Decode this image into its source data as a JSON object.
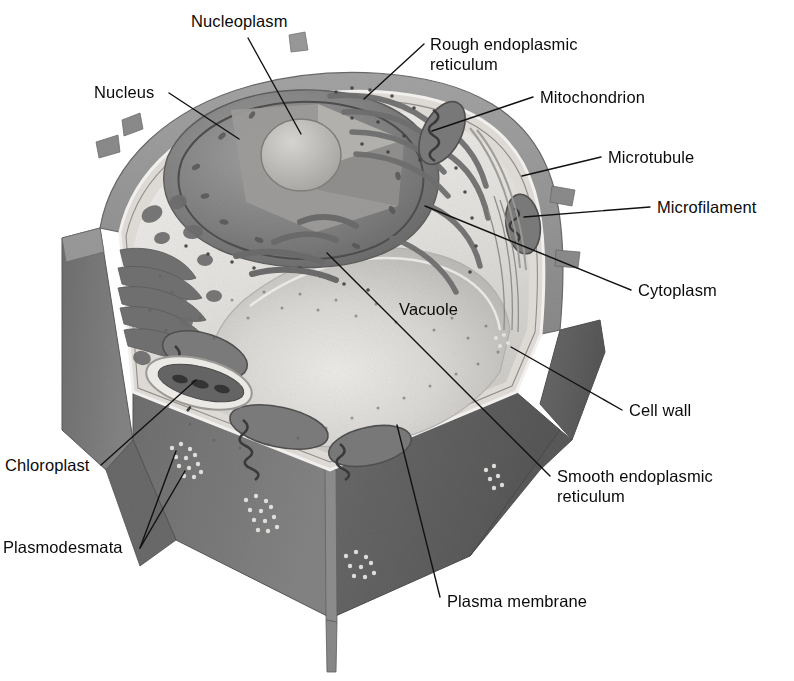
{
  "figure": {
    "background_color": "#ffffff",
    "label_text_color": "#0b0b0b",
    "leader_line_color": "#111111",
    "palette": {
      "cell_wall_outer": "#8f8f8f",
      "cell_wall_face_dark": "#6e6e6e",
      "cell_wall_face_darker": "#5c5c5c",
      "cell_wall_edge_light": "#c9c9c9",
      "cytoplasm": "#e2e0dd",
      "cytoplasm_light": "#efeeec",
      "vacuole": "#cfcdca",
      "vacuole_light": "#dedcd9",
      "nucleus": "#8a8a8a",
      "nucleus_dark": "#6f6f6f",
      "nucleolus": "#b9b7b4",
      "organelle_dark": "#555555",
      "organelle_mid": "#7b7b7b",
      "membrane_line": "#9a9a9a"
    }
  },
  "labels": [
    {
      "id": "nucleoplasm",
      "text": "Nucleoplasm",
      "x": 191,
      "y": 11,
      "anchor": "start",
      "leader": {
        "x1": 248,
        "y1": 38,
        "x2": 301,
        "y2": 134
      }
    },
    {
      "id": "nucleus",
      "text": "Nucleus",
      "x": 94,
      "y": 82,
      "anchor": "start",
      "leader": {
        "x1": 169,
        "y1": 93,
        "x2": 239,
        "y2": 139
      }
    },
    {
      "id": "rough-endoplasmic-reticulum",
      "text": "Rough endoplasmic\nreticulum",
      "x": 430,
      "y": 34,
      "anchor": "start",
      "leader": {
        "x1": 424,
        "y1": 44,
        "x2": 364,
        "y2": 99
      }
    },
    {
      "id": "mitochondrion",
      "text": "Mitochondrion",
      "x": 540,
      "y": 87,
      "anchor": "start",
      "leader": {
        "x1": 533,
        "y1": 97,
        "x2": 432,
        "y2": 131
      }
    },
    {
      "id": "microtubule",
      "text": "Microtubule",
      "x": 608,
      "y": 147,
      "anchor": "start",
      "leader": {
        "x1": 601,
        "y1": 157,
        "x2": 522,
        "y2": 176
      }
    },
    {
      "id": "microfilament",
      "text": "Microfilament",
      "x": 657,
      "y": 197,
      "anchor": "start",
      "leader": {
        "x1": 650,
        "y1": 207,
        "x2": 524,
        "y2": 217
      }
    },
    {
      "id": "cytoplasm",
      "text": "Cytoplasm",
      "x": 638,
      "y": 280,
      "anchor": "start",
      "leader": {
        "x1": 631,
        "y1": 290,
        "x2": 425,
        "y2": 206
      }
    },
    {
      "id": "vacuole",
      "text": "Vacuole",
      "x": 399,
      "y": 299,
      "anchor": "start",
      "leader": null
    },
    {
      "id": "cell-wall",
      "text": "Cell wall",
      "x": 629,
      "y": 400,
      "anchor": "start",
      "leader": {
        "x1": 622,
        "y1": 410,
        "x2": 511,
        "y2": 347
      }
    },
    {
      "id": "smooth-endoplasmic-reticulum",
      "text": "Smooth endoplasmic\nreticulum",
      "x": 557,
      "y": 466,
      "anchor": "start",
      "leader": {
        "x1": 550,
        "y1": 476,
        "x2": 327,
        "y2": 253
      }
    },
    {
      "id": "chloroplast",
      "text": "Chloroplast",
      "x": 5,
      "y": 455,
      "anchor": "start",
      "leader": {
        "x1": 101,
        "y1": 465,
        "x2": 196,
        "y2": 380
      }
    },
    {
      "id": "plasmodesmata",
      "text": "Plasmodesmata",
      "x": 3,
      "y": 537,
      "anchor": "start",
      "leader": null,
      "leaders": [
        {
          "x1": 140,
          "y1": 548,
          "x2": 176,
          "y2": 451
        },
        {
          "x1": 140,
          "y1": 548,
          "x2": 185,
          "y2": 471
        }
      ]
    },
    {
      "id": "plasma-membrane",
      "text": "Plasma membrane",
      "x": 447,
      "y": 591,
      "anchor": "start",
      "leader": {
        "x1": 440,
        "y1": 597,
        "x2": 397,
        "y2": 425
      }
    }
  ],
  "structures": [
    {
      "id": "cell-wall",
      "name": "Cell wall"
    },
    {
      "id": "plasma-membrane",
      "name": "Plasma membrane"
    },
    {
      "id": "cytoplasm",
      "name": "Cytoplasm"
    },
    {
      "id": "nucleus",
      "name": "Nucleus"
    },
    {
      "id": "nucleoplasm",
      "name": "Nucleoplasm"
    },
    {
      "id": "vacuole",
      "name": "Vacuole"
    },
    {
      "id": "chloroplast",
      "name": "Chloroplast"
    },
    {
      "id": "mitochondrion",
      "name": "Mitochondrion"
    },
    {
      "id": "rough-er",
      "name": "Rough endoplasmic reticulum"
    },
    {
      "id": "smooth-er",
      "name": "Smooth endoplasmic reticulum"
    },
    {
      "id": "golgi",
      "name": "Golgi apparatus"
    },
    {
      "id": "microtubule",
      "name": "Microtubule"
    },
    {
      "id": "microfilament",
      "name": "Microfilament"
    },
    {
      "id": "plasmodesmata",
      "name": "Plasmodesmata"
    }
  ]
}
